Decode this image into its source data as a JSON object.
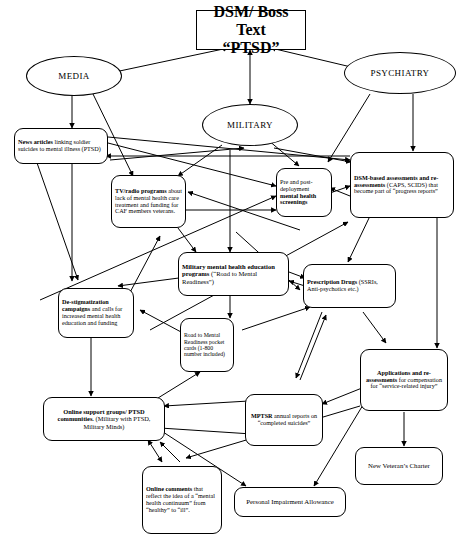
{
  "diagram": {
    "nodes": [
      {
        "id": "dsm_boss",
        "shape": "rect",
        "lines": [
          {
            "text": "DSM/ Boss Text",
            "bold": true
          },
          {
            "text": "“PTSD”",
            "bold": true
          }
        ]
      },
      {
        "id": "media",
        "shape": "ellipse",
        "lines": [
          {
            "text": "MEDIA",
            "bold": false
          }
        ]
      },
      {
        "id": "psychiatry",
        "shape": "ellipse",
        "lines": [
          {
            "text": "PSYCHIATRY",
            "bold": false
          }
        ]
      },
      {
        "id": "military",
        "shape": "ellipse",
        "lines": [
          {
            "text": "MILITARY",
            "bold": false
          }
        ]
      },
      {
        "id": "news_articles",
        "shape": "rounded",
        "lines": [
          {
            "text": "News articles",
            "bold": true
          },
          {
            "text": " linking soldier suicides to mental illness (PTSD)",
            "bold": false
          }
        ]
      },
      {
        "id": "tv_radio",
        "shape": "rounded",
        "lines": [
          {
            "text": "TV/radio programs",
            "bold": true
          },
          {
            "text": " about lack of mental health care treatment and funding for CAF members veterans.",
            "bold": false
          }
        ]
      },
      {
        "id": "screenings",
        "shape": "rounded",
        "lines": [
          {
            "text": "Pre and post-deployment ",
            "bold": false
          },
          {
            "text": "mental health screenings",
            "bold": true
          }
        ]
      },
      {
        "id": "dsm_assess",
        "shape": "rounded",
        "lines": [
          {
            "text": "DSM-based assessments and re-assessments",
            "bold": true
          },
          {
            "text": " (CAPS, SCIDS) that become part of  “progress reports”",
            "bold": false
          }
        ]
      },
      {
        "id": "mil_education",
        "shape": "rounded",
        "lines": [
          {
            "text": "Military mental health education programs",
            "bold": true
          },
          {
            "text": " (“Road to Mental Readiness”)",
            "bold": false
          }
        ]
      },
      {
        "id": "prescription",
        "shape": "rounded",
        "lines": [
          {
            "text": "Prescription Drugs",
            "bold": true
          },
          {
            "text": " (SSRIs, Anti-psychotics etc.)",
            "bold": false
          }
        ]
      },
      {
        "id": "destigma",
        "shape": "rounded",
        "lines": [
          {
            "text": "De-stigmatization campaigns",
            "bold": true
          },
          {
            "text": " and calls for increased mental health education and funding",
            "bold": false
          }
        ]
      },
      {
        "id": "pocket_cards",
        "shape": "rounded",
        "lines": [
          {
            "text": "Road to Mental Readiness pocket cards (1-800 number included)",
            "bold": false
          }
        ]
      },
      {
        "id": "applications",
        "shape": "rounded",
        "lines": [
          {
            "text": "Applications and re-assessments",
            "bold": true
          },
          {
            "text": " for compensation for “service-related injury”",
            "bold": false
          }
        ]
      },
      {
        "id": "online_support",
        "shape": "rounded",
        "lines": [
          {
            "text": "Online support groups/ PTSD communities.",
            "bold": true
          },
          {
            "text": " (Military with PTSD, Military Minds)",
            "bold": false
          }
        ]
      },
      {
        "id": "mptsr",
        "shape": "rounded",
        "lines": [
          {
            "text": "MPTSR",
            "bold": true
          },
          {
            "text": " annual reports on “completed suicides”",
            "bold": false
          }
        ]
      },
      {
        "id": "online_comm",
        "shape": "rounded",
        "lines": [
          {
            "text": "Online comments",
            "bold": true
          },
          {
            "text": " that reflect the idea of a “mental health continuum” from “healthy” to “ill”.",
            "bold": false
          }
        ]
      },
      {
        "id": "new_charter",
        "shape": "rounded",
        "lines": [
          {
            "text": "New Veteran’s Charter",
            "bold": false
          }
        ]
      },
      {
        "id": "pia",
        "shape": "rounded",
        "lines": [
          {
            "text": "Personal Impairment Allowance",
            "bold": false
          }
        ]
      }
    ],
    "node_labels": {
      "dsm_boss": "DSM/ Boss Text “PTSD”",
      "media": "MEDIA",
      "psychiatry": "PSYCHIATRY",
      "military": "MILITARY",
      "news_articles": "News articles linking soldier suicides to mental illness (PTSD)",
      "tv_radio": "TV/radio programs about lack of mental health care treatment and funding for CAF members veterans.",
      "screenings": "Pre and post-deployment mental health screenings",
      "dsm_assess": "DSM-based assessments and re-assessments (CAPS, SCIDS) that become part of “progress reports”",
      "mil_education": "Military mental health education programs (“Road to Mental Readiness”)",
      "prescription": "Prescription Drugs (SSRIs, Anti-psychotics etc.)",
      "destigma": "De-stigmatization campaigns and calls for increased mental health education and funding",
      "pocket_cards": "Road to Mental Readiness pocket cards (1-800 number included)",
      "applications": "Applications and re-assessments for compensation for “service-related injury”",
      "online_support": "Online support groups/ PTSD communities. (Military with PTSD, Military Minds)",
      "mptsr": "MPTSR annual reports on “completed suicides”",
      "online_comm": "Online comments that reflect the idea of a “mental health continuum” from “healthy” to “ill”.",
      "new_charter": "New Veteran’s Charter",
      "pia": "Personal Impairment Allowance"
    },
    "colors": {
      "line": "#000000",
      "node_fill": "#ffffff",
      "node_stroke": "#000000",
      "text": "#000000"
    }
  }
}
